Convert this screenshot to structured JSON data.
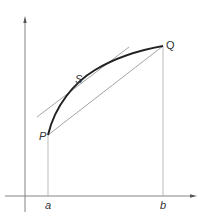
{
  "diagram": {
    "type": "mean-value-theorem",
    "points": {
      "P": {
        "label": "P"
      },
      "Q": {
        "label": "Q"
      },
      "S": {
        "label": "S"
      }
    },
    "x_ticks": {
      "a": {
        "label": "a"
      },
      "b": {
        "label": "b"
      }
    },
    "elements": [
      "x-axis",
      "y-axis",
      "curve P to Q",
      "chord PQ",
      "tangent at S parallel to PQ",
      "vertical line at a",
      "vertical line at b"
    ],
    "colors": {
      "curve": "#222222",
      "lines": "#9a9a9a",
      "axes": "#555555"
    }
  }
}
